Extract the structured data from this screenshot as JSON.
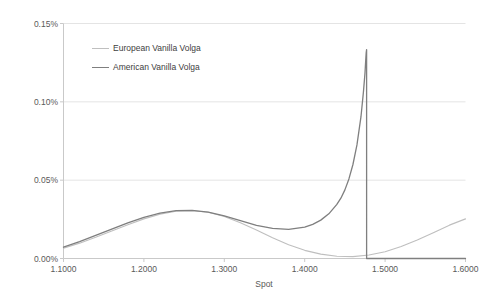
{
  "chart_data": {
    "type": "line",
    "title": "",
    "xlabel": "Spot",
    "ylabel": "Volga (CCY1%)",
    "xlim": [
      1.1,
      1.6
    ],
    "ylim": [
      0.0,
      0.0015
    ],
    "grid": true,
    "legend_position": "upper-left-inside",
    "x_tick_labels": [
      "1.1000",
      "1.2000",
      "1.3000",
      "1.4000",
      "1.5000",
      "1.6000"
    ],
    "x_tick_values": [
      1.1,
      1.2,
      1.3,
      1.4,
      1.5,
      1.6
    ],
    "y_tick_labels": [
      "0.00%",
      "0.05%",
      "0.10%",
      "0.15%"
    ],
    "y_tick_values": [
      0.0,
      0.0005,
      0.001,
      0.0015
    ],
    "series": [
      {
        "name": "European Vanilla Volga",
        "color": "#bfbfbf",
        "width": 1.1,
        "x": [
          1.1,
          1.12,
          1.14,
          1.16,
          1.18,
          1.2,
          1.22,
          1.24,
          1.26,
          1.28,
          1.3,
          1.32,
          1.34,
          1.36,
          1.38,
          1.4,
          1.42,
          1.44,
          1.46,
          1.48,
          1.5,
          1.52,
          1.54,
          1.56,
          1.58,
          1.6
        ],
        "y": [
          6.5e-05,
          9.8e-05,
          0.000135,
          0.000175,
          0.000215,
          0.000253,
          0.000283,
          0.000302,
          0.000305,
          0.000295,
          0.000268,
          0.000228,
          0.000182,
          0.000132,
          8.8e-05,
          5.2e-05,
          2.8e-05,
          1.4e-05,
          1.2e-05,
          2.2e-05,
          4.3e-05,
          7.6e-05,
          0.000118,
          0.000165,
          0.000213,
          0.000253
        ]
      },
      {
        "name": "American Vanilla Volga",
        "color": "#7f7f7f",
        "width": 1.3,
        "x": [
          1.1,
          1.12,
          1.14,
          1.16,
          1.18,
          1.2,
          1.22,
          1.24,
          1.26,
          1.28,
          1.3,
          1.32,
          1.34,
          1.36,
          1.38,
          1.4,
          1.41,
          1.42,
          1.43,
          1.44,
          1.445,
          1.45,
          1.455,
          1.46,
          1.465,
          1.47,
          1.473,
          1.475,
          1.476,
          1.4765,
          1.477,
          1.477,
          1.48,
          1.5,
          1.55,
          1.6
        ],
        "y": [
          7.2e-05,
          0.000108,
          0.000147,
          0.000188,
          0.000228,
          0.000263,
          0.000289,
          0.000305,
          0.000307,
          0.000296,
          0.000272,
          0.000242,
          0.000212,
          0.000192,
          0.000186,
          0.0002,
          0.000218,
          0.000245,
          0.000285,
          0.000345,
          0.000385,
          0.000438,
          0.000508,
          0.0006,
          0.000725,
          0.000905,
          0.00106,
          0.001185,
          0.001275,
          0.001315,
          0.001333,
          0.0,
          0.0,
          0.0,
          0.0,
          0.0
        ]
      }
    ]
  },
  "legend": {
    "items": [
      {
        "label": "European Vanilla Volga"
      },
      {
        "label": "American Vanilla Volga"
      }
    ]
  }
}
